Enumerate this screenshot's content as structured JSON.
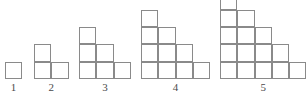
{
  "diagram": {
    "background_color": "#ffffff",
    "stroke_color": "#8a8a8a",
    "label_color": "#4a4a4a",
    "cell_size_px": 17.3,
    "stroke_width_px": 1.3,
    "baseline_y_px": 79,
    "canvas": {
      "width": 307,
      "height": 93
    },
    "figures": [
      {
        "label": "1",
        "step_count": 1,
        "cell_total": 1,
        "row_widths": [
          1
        ],
        "left_px": 5,
        "label_center_px": 13.6
      },
      {
        "label": "2",
        "step_count": 2,
        "cell_total": 3,
        "row_widths": [
          2,
          1
        ],
        "left_px": 34,
        "label_center_px": 51.3
      },
      {
        "label": "3",
        "step_count": 3,
        "cell_total": 6,
        "row_widths": [
          3,
          2,
          1
        ],
        "left_px": 79,
        "label_center_px": 104.9
      },
      {
        "label": "4",
        "step_count": 4,
        "cell_total": 10,
        "row_widths": [
          4,
          3,
          2,
          1
        ],
        "left_px": 141,
        "label_center_px": 175.6
      },
      {
        "label": "5",
        "step_count": 5,
        "cell_total": 15,
        "row_widths": [
          5,
          4,
          3,
          2,
          1
        ],
        "left_px": 220,
        "label_center_px": 263.3
      }
    ]
  }
}
